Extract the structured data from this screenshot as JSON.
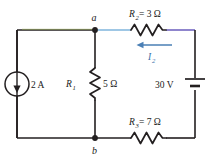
{
  "diagram": {
    "nodes": {
      "top_node_label": "a",
      "bottom_node_label": "b"
    },
    "components": {
      "current_source": {
        "value_label": "2 A",
        "symbol": "current-source-circle-down-arrow"
      },
      "r1": {
        "name_label": "R",
        "name_sub": "1",
        "value_label": "5 Ω",
        "symbol": "resistor-zigzag-vertical"
      },
      "r2": {
        "full_label_prefix": "R",
        "full_label_sub": "2",
        "full_label_value": "= 3 Ω",
        "symbol": "resistor-zigzag-horizontal"
      },
      "r3": {
        "full_label_prefix": "R",
        "full_label_sub": "3",
        "full_label_value": "= 7 Ω",
        "symbol": "resistor-zigzag-horizontal"
      },
      "voltage_source": {
        "value_label": "30 V",
        "symbol": "battery-cell-vertical"
      }
    },
    "currents": {
      "i2": {
        "label_prefix": "I",
        "label_sub": "2",
        "direction": "leftward",
        "symbol": "current-arrow-left"
      }
    },
    "colors": {
      "wire": "#231f20",
      "wire_green": "#7a8f4a",
      "wire_blue": "#7fb4dd",
      "wire_purple": "#7b6fc4",
      "current_arrow": "#4a7fb5",
      "label_text": "#222222"
    }
  }
}
